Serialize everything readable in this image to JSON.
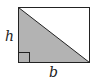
{
  "diagram": {
    "type": "right-triangle-in-rectangle",
    "labels": {
      "height": "h",
      "base": "b"
    },
    "colors": {
      "fill": "#b3b3b3",
      "stroke": "#222222",
      "background": "#ffffff"
    }
  }
}
